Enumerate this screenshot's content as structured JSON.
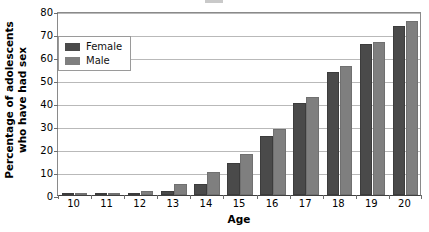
{
  "chart_data": {
    "type": "bar",
    "title": "",
    "xlabel": "Age",
    "ylabel": "Percentage of adolescents who have had sex",
    "ylabel_line1": "Percentage of adolescents",
    "ylabel_line2": "who have had sex",
    "categories": [
      "10",
      "11",
      "12",
      "13",
      "14",
      "15",
      "16",
      "17",
      "18",
      "19",
      "20"
    ],
    "series": [
      {
        "name": "Female",
        "color": "#4a4a4a",
        "values": [
          0.3,
          0.4,
          0.7,
          1.8,
          4.7,
          13.8,
          25.5,
          39.8,
          53.7,
          65.8,
          73.5
        ]
      },
      {
        "name": "Male",
        "color": "#7f7f7f",
        "values": [
          0.4,
          0.6,
          1.7,
          4.9,
          9.8,
          17.8,
          28.7,
          42.4,
          56.3,
          66.5,
          75.5
        ]
      }
    ],
    "ylim": [
      0,
      80
    ],
    "yticks": [
      0,
      10,
      20,
      30,
      40,
      50,
      60,
      70,
      80
    ],
    "ytick_labels": [
      "0",
      "10",
      "20",
      "30",
      "40",
      "50",
      "60",
      "70",
      "80"
    ],
    "grid": true,
    "grid_axis": "y",
    "legend_position": "upper-left-inside"
  },
  "legend": {
    "entries": [
      {
        "label": "Female",
        "swatch": "female-swatch"
      },
      {
        "label": "Male",
        "swatch": "male-swatch"
      }
    ]
  }
}
